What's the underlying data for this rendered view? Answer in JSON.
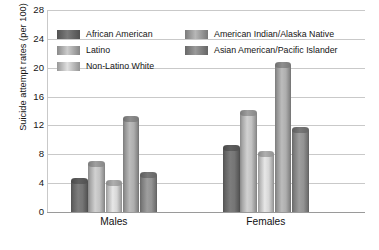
{
  "chart_data": {
    "type": "bar",
    "title": "",
    "xlabel": "",
    "ylabel": "Suicide attempt rates (per 100)",
    "categories": [
      "Males",
      "Females"
    ],
    "ylim": [
      0,
      28
    ],
    "yticks": [
      0,
      4,
      8,
      12,
      16,
      20,
      24,
      28
    ],
    "grid": true,
    "legend_position": "top",
    "series": [
      {
        "name": "African American",
        "values": [
          4.7,
          9.3
        ],
        "color": "#6f6f6f"
      },
      {
        "name": "Latino",
        "values": [
          7.1,
          14.2
        ],
        "color": "#b9b9b9"
      },
      {
        "name": "Non-Latino White",
        "values": [
          4.5,
          8.5
        ],
        "color": "#cccccc"
      },
      {
        "name": "American Indian/Alaska Native",
        "values": [
          13.3,
          20.8
        ],
        "color": "#a6a6a6"
      },
      {
        "name": "Asian American/Pacific Islander",
        "values": [
          5.5,
          11.8
        ],
        "color": "#8c8c8c"
      }
    ]
  },
  "axis": {
    "y_title": "Suicide attempt rates (per 100)",
    "tick_labels": [
      "28",
      "24",
      "20",
      "16",
      "12",
      "8",
      "4",
      "0"
    ]
  },
  "groups": [
    {
      "label": "Males"
    },
    {
      "label": "Females"
    }
  ],
  "legend": {
    "column_1": [
      {
        "label": "African American"
      },
      {
        "label": "Latino"
      },
      {
        "label": "Non-Latino White"
      }
    ],
    "column_2": [
      {
        "label": "American Indian/Alaska Native"
      },
      {
        "label": "Asian American/Pacific Islander"
      }
    ]
  }
}
